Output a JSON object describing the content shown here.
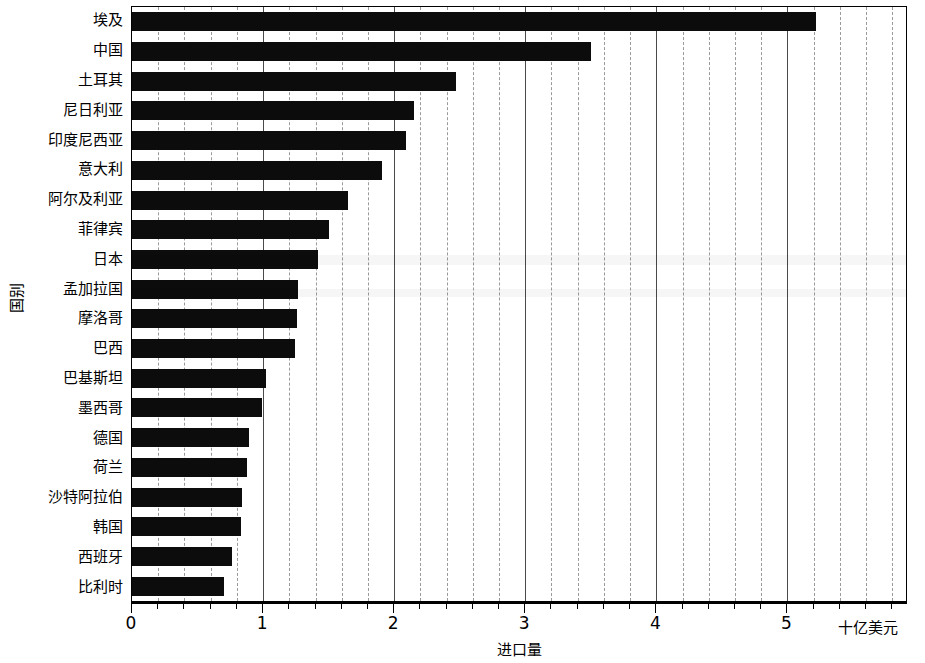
{
  "chart_data": {
    "type": "bar",
    "orientation": "horizontal",
    "title": "",
    "xlabel": "进口量",
    "ylabel": "国别",
    "x_unit_label": "十亿美元",
    "xlim": [
      0,
      5.92
    ],
    "xticks": [
      0,
      1,
      2,
      3,
      4,
      5
    ],
    "xtick_labels": [
      "0",
      "1",
      "2",
      "3",
      "4",
      "5"
    ],
    "minor_ticks_per_interval": 5,
    "grid": "vertical-major-solid-minor-dashed",
    "legend": "none",
    "bar_color": "#0c0c0c",
    "categories": [
      "埃及",
      "中国",
      "土耳其",
      "尼日利亚",
      "印度尼西亚",
      "意大利",
      "阿尔及利亚",
      "菲律宾",
      "日本",
      "孟加拉国",
      "摩洛哥",
      "巴西",
      "巴基斯坦",
      "墨西哥",
      "德国",
      "荷兰",
      "沙特阿拉伯",
      "韩国",
      "西班牙",
      "比利时"
    ],
    "values": [
      5.22,
      3.5,
      2.47,
      2.15,
      2.09,
      1.91,
      1.65,
      1.5,
      1.42,
      1.27,
      1.26,
      1.24,
      1.02,
      0.99,
      0.89,
      0.88,
      0.84,
      0.83,
      0.76,
      0.7
    ]
  }
}
